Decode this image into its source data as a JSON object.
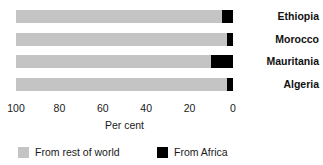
{
  "chart_data": {
    "type": "bar",
    "orientation": "horizontal",
    "stacked": true,
    "title": "",
    "subtitle": "",
    "xlabel": "Per cent",
    "ylabel": "",
    "xlim": [
      100,
      0
    ],
    "x_axis_reversed": true,
    "grid": false,
    "xticks": [
      100,
      80,
      60,
      40,
      20,
      0
    ],
    "xtick_labels": [
      "100",
      "80",
      "60",
      "40",
      "20",
      "0"
    ],
    "categories": [
      "Ethiopia",
      "Morocco",
      "Mauritania",
      "Algeria"
    ],
    "series": [
      {
        "name": "From rest of world",
        "color": "#c4c4c4",
        "values": [
          95,
          97,
          90,
          97
        ]
      },
      {
        "name": "From Africa",
        "color": "#000000",
        "values": [
          5,
          3,
          10,
          3
        ]
      }
    ],
    "legend": {
      "position": "bottom",
      "entries": [
        {
          "label": "From rest of world",
          "color": "#c4c4c4"
        },
        {
          "label": "From Africa",
          "color": "#000000"
        }
      ]
    }
  },
  "axis": {
    "tick_0": "100",
    "tick_1": "80",
    "tick_2": "60",
    "tick_3": "40",
    "tick_4": "20",
    "tick_5": "0",
    "title": "Per cent"
  },
  "categories": {
    "cat_0": "Ethiopia",
    "cat_1": "Morocco",
    "cat_2": "Mauritania",
    "cat_3": "Algeria"
  },
  "legend": {
    "entry_0_label": "From rest of world",
    "entry_1_label": "From Africa"
  },
  "colors": {
    "rest_of_world": "#c4c4c4",
    "africa": "#000000",
    "background": "#ffffff",
    "text": "#1a1a1a"
  }
}
